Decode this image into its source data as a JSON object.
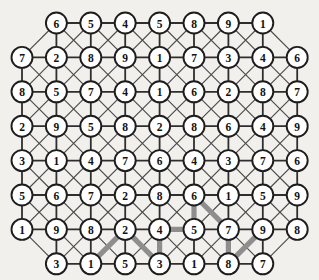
{
  "diagram": {
    "type": "grid-graph",
    "background_color": "#f2f0ec",
    "node_fill": "#ffffff",
    "node_stroke": "#1d1d1d",
    "edge_color": "#4a4a4a",
    "highlight_color": "#8e8e8e",
    "node_radius": 10.5,
    "col_spacing": 34.4,
    "row_spacing": 34.4,
    "origin_x": 22,
    "origin_y": 23,
    "rows": [
      {
        "index": 0,
        "offset": 1,
        "count": 7,
        "values": [
          6,
          5,
          4,
          5,
          8,
          9,
          1
        ]
      },
      {
        "index": 1,
        "offset": 0,
        "count": 9,
        "values": [
          7,
          2,
          8,
          9,
          1,
          7,
          3,
          4,
          6
        ]
      },
      {
        "index": 2,
        "offset": 0,
        "count": 9,
        "values": [
          8,
          5,
          7,
          4,
          1,
          6,
          2,
          8,
          7
        ]
      },
      {
        "index": 3,
        "offset": 0,
        "count": 9,
        "values": [
          2,
          9,
          5,
          8,
          2,
          8,
          6,
          4,
          9
        ]
      },
      {
        "index": 4,
        "offset": 0,
        "count": 9,
        "values": [
          3,
          1,
          4,
          7,
          6,
          4,
          3,
          7,
          6
        ]
      },
      {
        "index": 5,
        "offset": 0,
        "count": 9,
        "values": [
          5,
          6,
          7,
          2,
          8,
          6,
          1,
          5,
          9
        ]
      },
      {
        "index": 6,
        "offset": 0,
        "count": 9,
        "values": [
          1,
          9,
          8,
          2,
          4,
          5,
          7,
          9,
          8
        ]
      },
      {
        "index": 7,
        "offset": 1,
        "count": 7,
        "values": [
          3,
          1,
          5,
          3,
          1,
          8,
          7
        ]
      }
    ],
    "highlighted_path": {
      "label": "highlighted-route",
      "nodes": [
        {
          "row": 7,
          "col": 1,
          "value": 1
        },
        {
          "row": 6,
          "col": 3,
          "value": 2
        },
        {
          "row": 7,
          "col": 3,
          "value": 3
        },
        {
          "row": 6,
          "col": 4,
          "value": 4
        },
        {
          "row": 6,
          "col": 5,
          "value": 5
        },
        {
          "row": 5,
          "col": 5,
          "value": 6
        },
        {
          "row": 6,
          "col": 6,
          "value": 7
        },
        {
          "row": 7,
          "col": 5,
          "value": 8
        },
        {
          "row": 6,
          "col": 7,
          "value": 9
        }
      ],
      "segments": [
        {
          "from": [
            7,
            1
          ],
          "to": [
            6,
            3
          ]
        },
        {
          "from": [
            6,
            3
          ],
          "to": [
            7,
            3
          ]
        },
        {
          "from": [
            7,
            3
          ],
          "to": [
            6,
            4
          ]
        },
        {
          "from": [
            6,
            4
          ],
          "to": [
            6,
            5
          ]
        },
        {
          "from": [
            6,
            5
          ],
          "to": [
            5,
            5
          ]
        },
        {
          "from": [
            5,
            5
          ],
          "to": [
            6,
            6
          ]
        },
        {
          "from": [
            6,
            6
          ],
          "to": [
            7,
            5
          ]
        },
        {
          "from": [
            7,
            5
          ],
          "to": [
            6,
            7
          ]
        }
      ]
    }
  }
}
